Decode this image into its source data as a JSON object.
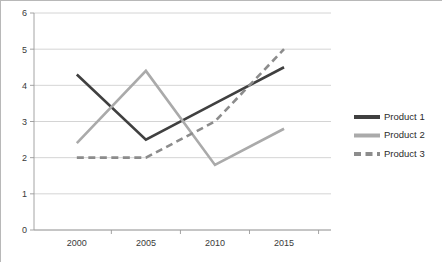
{
  "chart_data": {
    "type": "line",
    "title": "",
    "subtitle": "",
    "xlabel": "",
    "ylabel": "",
    "categories": [
      "2000",
      "2005",
      "2010",
      "2015"
    ],
    "x": [
      2000,
      2005,
      2010,
      2015
    ],
    "series": [
      {
        "name": "Product 1",
        "values": [
          4.3,
          2.5,
          3.5,
          4.5
        ],
        "color": "#404040",
        "style": "solid",
        "width": 2.6
      },
      {
        "name": "Product 2",
        "values": [
          2.4,
          4.4,
          1.8,
          2.8
        ],
        "color": "#aaaaaa",
        "style": "solid",
        "width": 2.6
      },
      {
        "name": "Product 3",
        "values": [
          2.0,
          2.0,
          3.0,
          5.0
        ],
        "color": "#8c8c8c",
        "style": "dashed",
        "width": 2.6
      }
    ],
    "ylim": [
      0,
      6
    ],
    "yticks": [
      0,
      1,
      2,
      3,
      4,
      5,
      6
    ],
    "ytick_labels": [
      "0",
      "1",
      "2",
      "3",
      "4",
      "5",
      "6"
    ],
    "xtick_labels": [
      "2000",
      "2005",
      "2010",
      "2015"
    ],
    "grid": {
      "horizontal": true,
      "vertical": false,
      "color": "#c9c9c9"
    },
    "legend": {
      "position": "right",
      "entries": [
        "Product 1",
        "Product 2",
        "Product 3"
      ]
    },
    "plot_background": "#ffffff",
    "border_color": "#b8b8b8"
  }
}
